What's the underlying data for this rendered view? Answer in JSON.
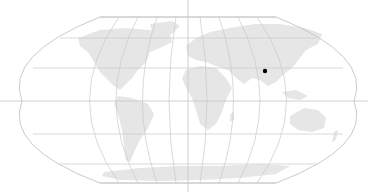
{
  "map": {
    "projection": "Robinson-like world projection",
    "colors": {
      "background": "#ffffff",
      "land": "#e6e6e6",
      "graticule": "#c9c9c9",
      "crosshair": "#c4c4c4",
      "marker": "#000000"
    },
    "crosshair": {
      "x": 188,
      "y": 101
    },
    "marker": {
      "x": 265,
      "y": 71,
      "label": ""
    }
  }
}
